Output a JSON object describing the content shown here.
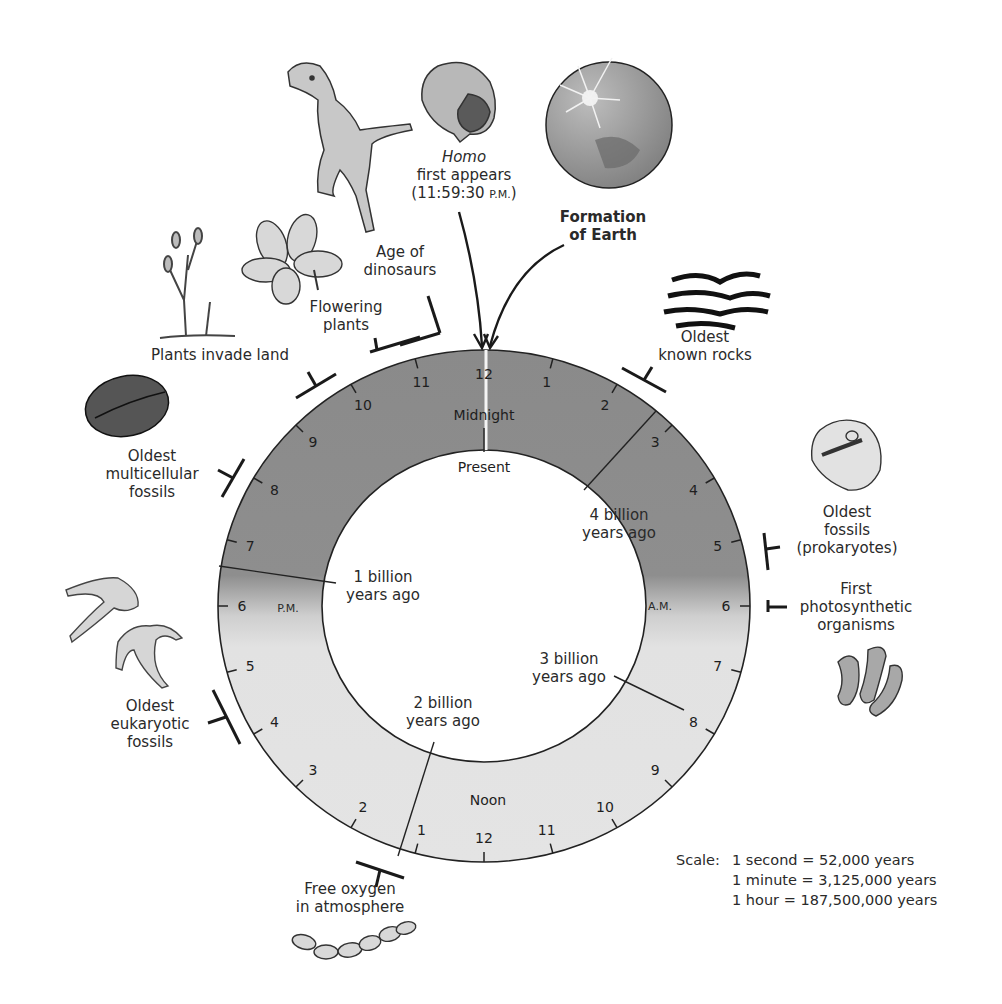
{
  "clock": {
    "center_label_top": "Midnight",
    "center_label_bottom": "Noon",
    "present_label": "Present",
    "am_label": "A.M.",
    "pm_label": "P.M.",
    "hour_labels_am": [
      "12",
      "1",
      "2",
      "3",
      "4",
      "5",
      "6",
      "7",
      "8",
      "9",
      "10",
      "11"
    ],
    "hour_labels_pm": [
      "12",
      "1",
      "2",
      "3",
      "4",
      "5",
      "6",
      "7",
      "8",
      "9",
      "10",
      "11"
    ],
    "colors": {
      "night": "#8c8c8c",
      "day": "#e4e4e4",
      "ring_stroke": "#222222"
    }
  },
  "inner_markers": [
    {
      "id": "4-billion",
      "lines": [
        "4 billion",
        "years ago"
      ]
    },
    {
      "id": "3-billion",
      "lines": [
        "3 billion",
        "years ago"
      ]
    },
    {
      "id": "2-billion",
      "lines": [
        "2 billion",
        "years ago"
      ]
    },
    {
      "id": "1-billion",
      "lines": [
        "1 billion",
        "years ago"
      ]
    }
  ],
  "events": [
    {
      "id": "homo",
      "lines": [
        "Homo",
        "first appears",
        "(11:59:30 P.M.)"
      ]
    },
    {
      "id": "formation-earth",
      "lines": [
        "Formation",
        "of Earth"
      ]
    },
    {
      "id": "age-dinosaurs",
      "lines": [
        "Age of",
        "dinosaurs"
      ]
    },
    {
      "id": "flowering-plants",
      "lines": [
        "Flowering",
        "plants"
      ]
    },
    {
      "id": "plants-land",
      "lines": [
        "Plants invade land"
      ]
    },
    {
      "id": "oldest-multicellular",
      "lines": [
        "Oldest",
        "multicellular",
        "fossils"
      ]
    },
    {
      "id": "oldest-eukaryotic",
      "lines": [
        "Oldest",
        "eukaryotic",
        "fossils"
      ]
    },
    {
      "id": "free-oxygen",
      "lines": [
        "Free oxygen",
        "in atmosphere"
      ]
    },
    {
      "id": "oldest-rocks",
      "lines": [
        "Oldest",
        "known rocks"
      ]
    },
    {
      "id": "oldest-fossils",
      "lines": [
        "Oldest",
        "fossils",
        "(prokaryotes)"
      ]
    },
    {
      "id": "first-photosynthetic",
      "lines": [
        "First",
        "photosynthetic",
        "organisms"
      ]
    }
  ],
  "homo_time_suffix": "P.M.",
  "scale": {
    "title": "Scale:",
    "rows": [
      {
        "unit": "1 second",
        "eq": "=",
        "value": "52,000 years"
      },
      {
        "unit": "1 minute",
        "eq": "=",
        "value": "3,125,000 years"
      },
      {
        "unit": "1 hour",
        "eq": "=",
        "value": "187,500,000 years"
      }
    ]
  },
  "icons": [
    "dinosaur-icon",
    "human-head-icon",
    "earth-icon",
    "rocks-icon",
    "flower-icon",
    "early-plant-icon",
    "multicellular-fossil-icon",
    "prokaryote-fossil-icon",
    "cyanobacteria-icon",
    "eukaryote-fossil-icon",
    "oxygen-chain-icon"
  ]
}
